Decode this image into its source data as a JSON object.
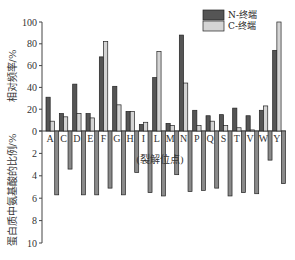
{
  "chart_data": {
    "type": "bar",
    "title": "",
    "xlabel": "(裂解位点)",
    "ylabel_top": "相对频率/%",
    "ylabel_bottom": "蛋白质中氨基酸的比例/%",
    "ylim_top": [
      0,
      100
    ],
    "yticks_top": [
      0,
      20,
      40,
      60,
      80,
      100
    ],
    "ylim_bottom": [
      0,
      10
    ],
    "yticks_bottom": [
      0,
      2,
      4,
      6,
      8,
      10
    ],
    "categories": [
      "A",
      "C",
      "D",
      "E",
      "F",
      "G",
      "H",
      "I",
      "L",
      "M",
      "N",
      "P",
      "Q",
      "S",
      "T",
      "V",
      "W",
      "Y"
    ],
    "series": [
      {
        "name": "N-终端",
        "color": "#555555",
        "axis": "top",
        "values": [
          31,
          16,
          43,
          16,
          68,
          41,
          18,
          6,
          49,
          7,
          88,
          19,
          14,
          15,
          21,
          14,
          19,
          74
        ]
      },
      {
        "name": "C-终端",
        "color": "#d4d4d4",
        "axis": "top",
        "values": [
          9,
          13,
          16,
          12,
          82,
          24,
          18,
          8,
          73,
          5,
          44,
          5,
          9,
          5,
          3,
          1,
          23,
          100
        ]
      },
      {
        "name": "蛋白质中氨基酸的比例",
        "color": "#8a8a8a",
        "axis": "bottom",
        "values": [
          5.7,
          3.4,
          5.7,
          5.7,
          5.1,
          5.7,
          3.7,
          5.5,
          5.8,
          3.9,
          5.4,
          5.3,
          5.1,
          5.8,
          5.5,
          5.6,
          2.6,
          4.7
        ]
      }
    ],
    "legend": {
      "position": "top-right",
      "entries": [
        "N-终端",
        "C-终端"
      ]
    },
    "grid": false
  }
}
